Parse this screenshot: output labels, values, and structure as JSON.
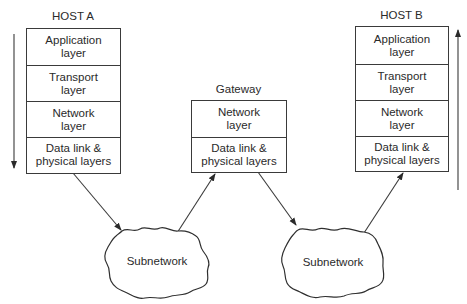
{
  "diagram": {
    "nodes": [
      {
        "id": "host_a",
        "title": "HOST A",
        "layers": [
          "Application\nlayer",
          "Transport\nlayer",
          "Network\nlayer",
          "Data link &\nphysical layers"
        ],
        "flow_arrow": "down"
      },
      {
        "id": "gateway",
        "title": "Gateway",
        "layers": [
          "Network\nlayer",
          "Data link &\nphysical layers"
        ]
      },
      {
        "id": "host_b",
        "title": "HOST B",
        "layers": [
          "Application\nlayer",
          "Transport\nlayer",
          "Network\nlayer",
          "Data link &\nphysical layers"
        ],
        "flow_arrow": "up"
      }
    ],
    "clouds": [
      {
        "id": "subnet_1",
        "label": "Subnetwork"
      },
      {
        "id": "subnet_2",
        "label": "Subnetwork"
      }
    ],
    "edges": [
      {
        "from": "host_a",
        "to": "subnet_1"
      },
      {
        "from": "subnet_1",
        "to": "gateway"
      },
      {
        "from": "gateway",
        "to": "subnet_2"
      },
      {
        "from": "subnet_2",
        "to": "host_b"
      }
    ],
    "colors": {
      "line": "#3a3a3a",
      "text": "#2a2a2a",
      "background": "#ffffff"
    }
  }
}
